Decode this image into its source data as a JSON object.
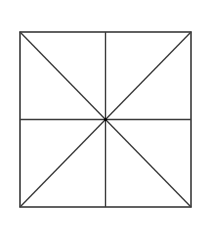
{
  "diagram": {
    "type": "geometric-figure",
    "square": {
      "x1": 20,
      "y1": 32,
      "x2": 191,
      "y2": 207
    },
    "center": {
      "x": 105.5,
      "y": 119.5
    },
    "stroke_color": "#3a3a3a",
    "center_dot_color": "#000000",
    "background": "#ffffff",
    "segments": [
      {
        "name": "diagonal-top-left-to-bottom-right",
        "x1": 20,
        "y1": 32,
        "x2": 191,
        "y2": 207
      },
      {
        "name": "diagonal-top-right-to-bottom-left",
        "x1": 191,
        "y1": 32,
        "x2": 20,
        "y2": 207
      },
      {
        "name": "vertical-midline",
        "x1": 105.5,
        "y1": 32,
        "x2": 105.5,
        "y2": 207
      },
      {
        "name": "horizontal-midline",
        "x1": 20,
        "y1": 119.5,
        "x2": 191,
        "y2": 119.5
      }
    ],
    "region_count": 8
  }
}
